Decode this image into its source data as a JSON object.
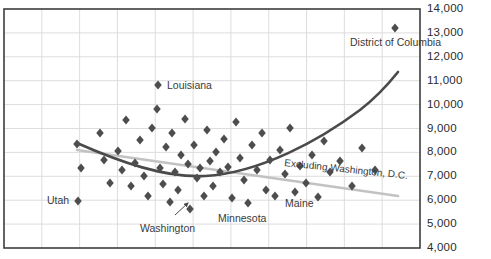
{
  "chart_data": {
    "type": "scatter",
    "title": "",
    "xlabel": "",
    "ylabel": "",
    "ylim": [
      4000,
      14000
    ],
    "ytick_step": 1000,
    "ytick_labels": [
      "14,000",
      "13,000",
      "12,000",
      "11,000",
      "10,000",
      "9,000",
      "8,000",
      "7,000",
      "6,000",
      "5,000",
      "4,000"
    ],
    "ytick_values": [
      14000,
      13000,
      12000,
      11000,
      10000,
      9000,
      8000,
      7000,
      6000,
      5000,
      4000
    ],
    "grid": {
      "horizontal": true,
      "vertical": true,
      "vertical_count": 11,
      "color": "#d9d9d9"
    },
    "legend_position": "inline-annotation",
    "marker": {
      "shape": "diamond",
      "color": "#4d4d4d",
      "size": 6
    },
    "points": [
      {
        "px": 77,
        "py": 144,
        "value": 8450
      },
      {
        "px": 81,
        "py": 168,
        "value": 7430
      },
      {
        "px": 78,
        "py": 201,
        "value": 6050,
        "label": "Utah"
      },
      {
        "px": 100,
        "py": 133,
        "value": 8900
      },
      {
        "px": 104,
        "py": 160,
        "value": 7770
      },
      {
        "px": 110,
        "py": 183,
        "value": 6800
      },
      {
        "px": 118,
        "py": 151,
        "value": 8270
      },
      {
        "px": 122,
        "py": 170,
        "value": 7360
      },
      {
        "px": 126,
        "py": 120,
        "value": 9430
      },
      {
        "px": 131,
        "py": 186,
        "value": 6680
      },
      {
        "px": 135,
        "py": 163,
        "value": 7640
      },
      {
        "px": 140,
        "py": 140,
        "value": 8610
      },
      {
        "px": 144,
        "py": 176,
        "value": 7100
      },
      {
        "px": 148,
        "py": 196,
        "value": 6260
      },
      {
        "px": 152,
        "py": 128,
        "value": 9100
      },
      {
        "px": 157,
        "py": 109,
        "value": 9890
      },
      {
        "px": 158,
        "py": 85,
        "value": 10900,
        "label": "Louisiana"
      },
      {
        "px": 160,
        "py": 168,
        "value": 7430
      },
      {
        "px": 163,
        "py": 184,
        "value": 6760
      },
      {
        "px": 166,
        "py": 147,
        "value": 8320
      },
      {
        "px": 170,
        "py": 202,
        "value": 6010
      },
      {
        "px": 172,
        "py": 133,
        "value": 8900
      },
      {
        "px": 175,
        "py": 172,
        "value": 7260
      },
      {
        "px": 178,
        "py": 190,
        "value": 6510
      },
      {
        "px": 181,
        "py": 155,
        "value": 7980
      },
      {
        "px": 185,
        "py": 119,
        "value": 9470
      },
      {
        "px": 188,
        "py": 164,
        "value": 7600
      },
      {
        "px": 190,
        "py": 209,
        "value": 5720,
        "label": "Washington"
      },
      {
        "px": 194,
        "py": 145,
        "value": 8400
      },
      {
        "px": 197,
        "py": 178,
        "value": 7020
      },
      {
        "px": 200,
        "py": 168,
        "value": 7430
      },
      {
        "px": 204,
        "py": 196,
        "value": 6260
      },
      {
        "px": 207,
        "py": 130,
        "value": 9010
      },
      {
        "px": 210,
        "py": 161,
        "value": 7720
      },
      {
        "px": 213,
        "py": 186,
        "value": 6680
      },
      {
        "px": 216,
        "py": 152,
        "value": 8100
      },
      {
        "px": 220,
        "py": 172,
        "value": 7260
      },
      {
        "px": 224,
        "py": 139,
        "value": 8650
      },
      {
        "px": 228,
        "py": 167,
        "value": 7470
      },
      {
        "px": 232,
        "py": 198,
        "value": 6170
      },
      {
        "px": 236,
        "py": 122,
        "value": 9350
      },
      {
        "px": 240,
        "py": 158,
        "value": 7850
      },
      {
        "px": 244,
        "py": 180,
        "value": 6930
      },
      {
        "px": 248,
        "py": 203,
        "value": 5970,
        "label": "Minnesota"
      },
      {
        "px": 252,
        "py": 145,
        "value": 8400
      },
      {
        "px": 257,
        "py": 170,
        "value": 7360
      },
      {
        "px": 262,
        "py": 133,
        "value": 8900
      },
      {
        "px": 266,
        "py": 190,
        "value": 6510
      },
      {
        "px": 270,
        "py": 160,
        "value": 7770
      },
      {
        "px": 275,
        "py": 196,
        "value": 6260
      },
      {
        "px": 280,
        "py": 150,
        "value": 8190
      },
      {
        "px": 285,
        "py": 174,
        "value": 7180
      },
      {
        "px": 290,
        "py": 128,
        "value": 9100
      },
      {
        "px": 295,
        "py": 192,
        "value": 6430
      },
      {
        "px": 300,
        "py": 166,
        "value": 7510
      },
      {
        "px": 306,
        "py": 183,
        "value": 6800
      },
      {
        "px": 312,
        "py": 155,
        "value": 7980
      },
      {
        "px": 318,
        "py": 197,
        "value": 6220,
        "label": "Maine"
      },
      {
        "px": 324,
        "py": 141,
        "value": 8570
      },
      {
        "px": 330,
        "py": 172,
        "value": 7260
      },
      {
        "px": 340,
        "py": 161,
        "value": 7720
      },
      {
        "px": 352,
        "py": 186,
        "value": 6680
      },
      {
        "px": 362,
        "py": 148,
        "value": 8280
      },
      {
        "px": 375,
        "py": 170,
        "value": 7360
      },
      {
        "px": 395,
        "py": 28,
        "value": 13380,
        "label": "District of Columbia"
      }
    ],
    "trendlines": [
      {
        "name": "all-states-quadratic",
        "color": "#4a4a4a",
        "width": 2.6,
        "style": "curve",
        "path": "M 77,143 C 120,162 165,178 205,176 C 260,173 320,140 360,110 C 378,96 390,82 398,72"
      },
      {
        "name": "Excluding Washington, D.C.",
        "color": "#c2c2c2",
        "width": 2.6,
        "style": "line",
        "label": "Excluding Washington, D.C.",
        "path": "M 77,150 L 398,196"
      }
    ],
    "annotations": [
      {
        "name": "district-of-columbia-label",
        "text": "District of Columbia",
        "x": 350,
        "y": 36
      },
      {
        "name": "louisiana-label",
        "text": "Louisiana",
        "x": 167,
        "y": 79
      },
      {
        "name": "utah-label",
        "text": "Utah",
        "x": 47,
        "y": 194
      },
      {
        "name": "washington-label",
        "text": "Washington",
        "x": 140,
        "y": 222
      },
      {
        "name": "minnesota-label",
        "text": "Minnesota",
        "x": 218,
        "y": 212
      },
      {
        "name": "maine-label",
        "text": "Maine",
        "x": 285,
        "y": 197
      },
      {
        "name": "excluding-dc-label",
        "text": "Excluding Washington, D.C.",
        "x": 285,
        "y": 157,
        "rotate": 6
      }
    ],
    "leader_lines": [
      {
        "name": "washington-leader",
        "path": "M 175,215 L 188,203",
        "arrow_at": [
          188,
          203
        ]
      }
    ],
    "frame": {
      "left": 4,
      "top": 9,
      "right": 420,
      "bottom": 248,
      "border_color": "#3d3d3d"
    }
  },
  "axis": {
    "tick_label_x": 427
  }
}
